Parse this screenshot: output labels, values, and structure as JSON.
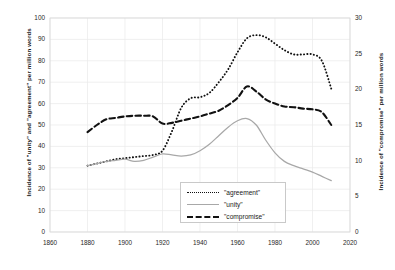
{
  "chart_data": {
    "type": "line",
    "title": "",
    "xlabel": "",
    "ylabel": "Incidence of \"unity\" and \"agreement\" per million words",
    "ylabel_secondary": "Incidence of \"compromise\" per million words",
    "xlim": [
      1860,
      2020
    ],
    "ylim": [
      0,
      100
    ],
    "ylim_secondary": [
      0,
      30
    ],
    "xticks": [
      1860,
      1880,
      1900,
      1920,
      1940,
      1960,
      1980,
      2000,
      2020
    ],
    "yticks": [
      0,
      10,
      20,
      30,
      40,
      50,
      60,
      70,
      80,
      90,
      100
    ],
    "yticks_secondary": [
      0,
      5,
      10,
      15,
      20,
      25,
      30
    ],
    "grid": true,
    "legend_position": "bottom-center",
    "series": [
      {
        "name": "\"agreement\"",
        "axis": "left",
        "style": "dotted",
        "color": "#111111",
        "x": [
          1880,
          1885,
          1890,
          1895,
          1900,
          1905,
          1910,
          1915,
          1920,
          1925,
          1930,
          1935,
          1940,
          1945,
          1950,
          1955,
          1960,
          1965,
          1970,
          1975,
          1980,
          1985,
          1990,
          1995,
          2000,
          2005,
          2010
        ],
        "values": [
          31,
          32,
          33,
          34,
          34.5,
          35,
          35.5,
          36,
          38,
          47,
          58,
          62.5,
          63,
          65,
          70,
          76,
          84,
          90.5,
          92,
          91,
          88,
          85,
          83,
          83,
          83,
          80,
          67
        ]
      },
      {
        "name": "\"unity\"",
        "axis": "left",
        "style": "solid",
        "color": "#a8a8a8",
        "x": [
          1880,
          1885,
          1890,
          1895,
          1900,
          1905,
          1910,
          1915,
          1920,
          1925,
          1930,
          1935,
          1940,
          1945,
          1950,
          1955,
          1960,
          1965,
          1970,
          1975,
          1980,
          1985,
          1990,
          1995,
          2000,
          2005,
          2010
        ],
        "values": [
          31,
          32,
          33,
          33.5,
          34,
          33,
          33.5,
          35,
          36.5,
          36,
          35.5,
          36,
          38,
          41,
          45,
          49,
          52,
          53,
          50,
          43,
          37,
          33,
          31,
          29.5,
          28,
          26,
          24
        ]
      },
      {
        "name": "\"compromise\"",
        "axis": "right",
        "style": "dashed",
        "color": "#111111",
        "x": [
          1880,
          1885,
          1890,
          1895,
          1900,
          1905,
          1910,
          1915,
          1920,
          1925,
          1930,
          1935,
          1940,
          1945,
          1950,
          1955,
          1960,
          1965,
          1970,
          1975,
          1980,
          1985,
          1990,
          1995,
          2000,
          2005,
          2010
        ],
        "values": [
          14.0,
          15.0,
          15.8,
          16.0,
          16.2,
          16.3,
          16.3,
          16.2,
          15.2,
          15.3,
          15.6,
          15.9,
          16.2,
          16.6,
          17.0,
          17.8,
          18.8,
          20.4,
          19.7,
          18.6,
          18.0,
          17.6,
          17.5,
          17.3,
          17.2,
          16.8,
          15.0
        ]
      }
    ]
  },
  "legend": {
    "items": [
      {
        "label": "\"agreement\""
      },
      {
        "label": "\"unity\""
      },
      {
        "label": "\"compromise\""
      }
    ]
  }
}
